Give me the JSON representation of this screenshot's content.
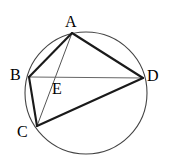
{
  "figure": {
    "width": 171,
    "height": 163,
    "background": "#ffffff",
    "stroke_color": "#1a1a1a",
    "thin_stroke_color": "#555555",
    "circle_stroke_color": "#444444"
  },
  "circle": {
    "name": "circumscribed-circle",
    "cx": 86,
    "cy": 93,
    "r": 61,
    "stroke_width": 1.1
  },
  "points": {
    "A": {
      "label": "A",
      "x": 72,
      "y": 33,
      "label_x": 65,
      "label_y": 14
    },
    "B": {
      "label": "B",
      "x": 29,
      "y": 77,
      "label_x": 10,
      "label_y": 67
    },
    "C": {
      "label": "C",
      "x": 37,
      "y": 126,
      "label_x": 17,
      "label_y": 124
    },
    "D": {
      "label": "D",
      "x": 143,
      "y": 78,
      "label_x": 147,
      "label_y": 68
    },
    "E": {
      "label": "E",
      "x": 51,
      "y": 78,
      "label_x": 52,
      "label_y": 81
    }
  },
  "segments": [
    {
      "name": "segment-AB",
      "from": "A",
      "to": "B",
      "weight": "thick",
      "x1": 72,
      "y1": 33,
      "x2": 29,
      "y2": 77
    },
    {
      "name": "segment-AD",
      "from": "A",
      "to": "D",
      "weight": "thick",
      "x1": 72,
      "y1": 33,
      "x2": 143,
      "y2": 78
    },
    {
      "name": "segment-BC",
      "from": "B",
      "to": "C",
      "weight": "thick",
      "x1": 29,
      "y1": 77,
      "x2": 37,
      "y2": 126
    },
    {
      "name": "segment-CD",
      "from": "C",
      "to": "D",
      "weight": "thick",
      "x1": 37,
      "y1": 126,
      "x2": 143,
      "y2": 78
    },
    {
      "name": "segment-AC",
      "from": "A",
      "to": "C",
      "weight": "thin",
      "x1": 72,
      "y1": 33,
      "x2": 37,
      "y2": 126
    },
    {
      "name": "segment-BD",
      "from": "B",
      "to": "D",
      "weight": "thin",
      "x1": 29,
      "y1": 77,
      "x2": 143,
      "y2": 78
    }
  ],
  "labels": {
    "A": "A",
    "B": "B",
    "C": "C",
    "D": "D",
    "E": "E"
  }
}
